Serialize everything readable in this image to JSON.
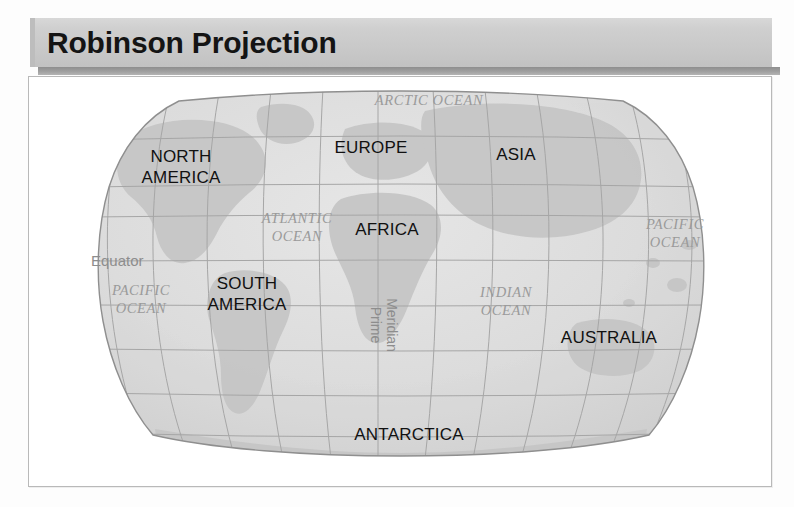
{
  "header": {
    "title": "Robinson Projection"
  },
  "map": {
    "projection_name": "Robinson Projection",
    "continents": [
      {
        "id": "north-america",
        "label": "NORTH\nAMERICA",
        "line1": "NORTH",
        "line2": "AMERICA",
        "x": 152,
        "y": 85
      },
      {
        "id": "europe",
        "label": "EUROPE",
        "line1": "EUROPE",
        "line2": "",
        "x": 342,
        "y": 76
      },
      {
        "id": "asia",
        "label": "ASIA",
        "line1": "ASIA",
        "line2": "",
        "x": 487,
        "y": 83
      },
      {
        "id": "africa",
        "label": "AFRICA",
        "line1": "AFRICA",
        "line2": "",
        "x": 358,
        "y": 158
      },
      {
        "id": "south-america",
        "label": "SOUTH\nAMERICA",
        "line1": "SOUTH",
        "line2": "AMERICA",
        "x": 218,
        "y": 212
      },
      {
        "id": "australia",
        "label": "AUSTRALIA",
        "line1": "AUSTRALIA",
        "line2": "",
        "x": 580,
        "y": 266
      },
      {
        "id": "antarctica",
        "label": "ANTARCTICA",
        "line1": "ANTARCTICA",
        "line2": "",
        "x": 380,
        "y": 363
      }
    ],
    "oceans": [
      {
        "id": "arctic-ocean",
        "line1": "ARCTIC OCEAN",
        "line2": "",
        "x": 400,
        "y": 28
      },
      {
        "id": "atlantic-ocean",
        "line1": "ATLANTIC",
        "line2": "OCEAN",
        "x": 268,
        "y": 146
      },
      {
        "id": "pacific-ocean-right",
        "line1": "PACIFIC",
        "line2": "OCEAN",
        "x": 646,
        "y": 152
      },
      {
        "id": "indian-ocean",
        "line1": "INDIAN",
        "line2": "OCEAN",
        "x": 477,
        "y": 220
      },
      {
        "id": "pacific-ocean-left",
        "line1": "PACIFIC",
        "line2": "OCEAN",
        "x": 112,
        "y": 218
      }
    ],
    "reference_lines": [
      {
        "id": "equator",
        "label": "Equator",
        "x": 62,
        "y": 184,
        "orientation": "horizontal"
      },
      {
        "id": "prime-meridian",
        "line1": "Prime",
        "line2": "Meridian",
        "x": 349,
        "y": 248,
        "orientation": "vertical"
      }
    ],
    "colors": {
      "land_fill": "#c9c9c9",
      "ocean_fill": "#dcdcdc",
      "graticule": "#a8a8a8",
      "outline": "#8f8f8f",
      "continent_text": "#111111",
      "ocean_text": "#9a9a9a",
      "reference_text": "#8d8d8d"
    },
    "graticule": {
      "latitude_interval_degrees": 30,
      "longitude_interval_degrees": 30,
      "shown": true
    }
  }
}
